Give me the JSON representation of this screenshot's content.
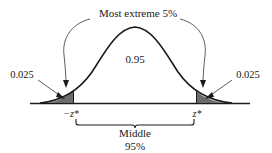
{
  "diagram": {
    "type": "normal-distribution-two-tailed",
    "top_label": "Most extreme 5%",
    "center_label": "0.95",
    "left_tail_label": "0.025",
    "right_tail_label": "0.025",
    "left_critical_label": "−z*",
    "right_critical_label": "z*",
    "bottom_label_line1": "Middle",
    "bottom_label_line2": "95%",
    "colors": {
      "curve": "#1a1a1a",
      "tail_fill": "#6b6b6b",
      "arrow": "#333333",
      "text": "#1a1a1a"
    }
  }
}
